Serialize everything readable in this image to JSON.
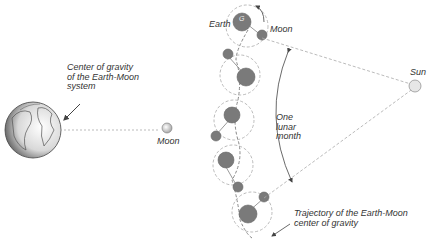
{
  "left_panel": {
    "cog_label_lines": [
      "Center of gravity",
      "of the Earth-Moon",
      "system"
    ],
    "moon_label": "Moon"
  },
  "right_panel": {
    "earth_label": "Earth",
    "g_label": "G",
    "moon_label": "Moon",
    "month_label_lines": [
      "One",
      "lunar",
      "month"
    ],
    "sun_label": "Sun",
    "trajectory_label_lines": [
      "Trajectory of the Earth-Moon",
      "center of gravity"
    ]
  },
  "colors": {
    "body_fill": "#7a7a7a",
    "dashed_line": "#aaaaaa",
    "text": "#333333",
    "sun_fill": "#e6e6e6"
  }
}
